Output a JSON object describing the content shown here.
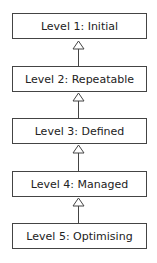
{
  "diagram": {
    "type": "hierarchy",
    "levels": [
      {
        "label": "Level 1: Initial"
      },
      {
        "label": "Level 2: Repeatable"
      },
      {
        "label": "Level 3: Defined"
      },
      {
        "label": "Level 4: Managed"
      },
      {
        "label": "Level 5: Optimising"
      }
    ],
    "connector": "hollow-triangle-arrow (generalization) pointing up",
    "colors": {
      "border": "#444444",
      "text": "#222222",
      "background": "#ffffff"
    }
  }
}
